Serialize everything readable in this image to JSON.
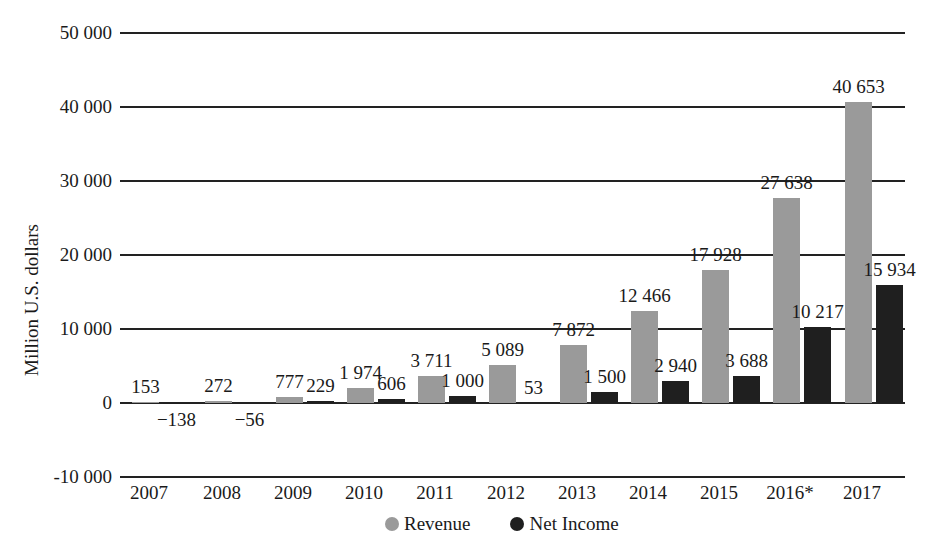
{
  "chart_data": {
    "type": "bar",
    "title": "",
    "xlabel": "",
    "ylabel": "Million U.S. dollars",
    "ylim": [
      -10000,
      50000
    ],
    "yticks": [
      50000,
      40000,
      30000,
      20000,
      10000,
      0,
      -10000
    ],
    "ytick_labels": [
      "50 000",
      "40 000",
      "30 000",
      "20 000",
      "10 000",
      "0",
      "-10 000"
    ],
    "grid": true,
    "legend_position": "bottom",
    "categories": [
      "2007",
      "2008",
      "2009",
      "2010",
      "2011",
      "2012",
      "2013",
      "2014",
      "2015",
      "2016*",
      "2017"
    ],
    "series": [
      {
        "name": "Revenue",
        "color": "#9a9a9a",
        "values": [
          153,
          272,
          777,
          1974,
          3711,
          5089,
          7872,
          12466,
          17928,
          27638,
          40653
        ],
        "labels": [
          "153",
          "272",
          "777",
          "1 974",
          "3 711",
          "5 089",
          "7 872",
          "12 466",
          "17 928",
          "27 638",
          "40 653"
        ]
      },
      {
        "name": "Net Income",
        "color": "#1f1f1f",
        "values": [
          -138,
          -56,
          229,
          606,
          1000,
          53,
          1500,
          2940,
          3688,
          10217,
          15934
        ],
        "labels": [
          "−138",
          "−56",
          "229",
          "606",
          "1 000",
          "53",
          "1 500",
          "2 940",
          "3 688",
          "10 217",
          "15 934"
        ]
      }
    ]
  },
  "legend": {
    "items": [
      {
        "label": "Revenue",
        "color": "#9a9a9a"
      },
      {
        "label": "Net Income",
        "color": "#1f1f1f"
      }
    ]
  }
}
